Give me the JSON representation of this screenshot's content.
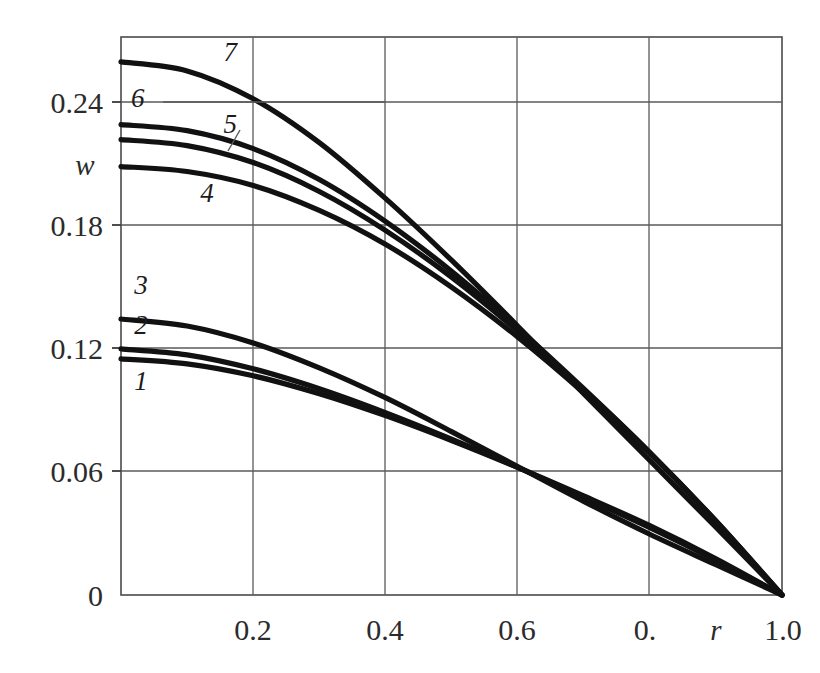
{
  "chart_data": {
    "type": "line",
    "title": "",
    "xlabel": "r",
    "ylabel": "w",
    "xlim": [
      0.0,
      1.0
    ],
    "ylim": [
      0.0,
      0.28
    ],
    "grid": true,
    "legend": "inline-curve-numbers",
    "x_ticks": [
      {
        "value": 0.2,
        "label": "0.2"
      },
      {
        "value": 0.4,
        "label": "0.4"
      },
      {
        "value": 0.6,
        "label": "0.6"
      },
      {
        "value": 0.8,
        "label": "0."
      },
      {
        "value": 1.0,
        "label": "1.0"
      }
    ],
    "y_ticks": [
      {
        "value": 0.0,
        "label": "0"
      },
      {
        "value": 0.06,
        "label": "0.06"
      },
      {
        "value": 0.12,
        "label": "0.12"
      },
      {
        "value": 0.18,
        "label": "0.18"
      },
      {
        "value": 0.24,
        "label": "0.24"
      }
    ],
    "x": [
      0.0,
      0.1,
      0.2,
      0.3,
      0.4,
      0.5,
      0.6,
      0.7,
      0.8,
      0.9,
      1.0
    ],
    "series": [
      {
        "name": "1",
        "label": "1",
        "values": [
          0.1185,
          0.116,
          0.11,
          0.101,
          0.09,
          0.0775,
          0.064,
          0.0497,
          0.0348,
          0.0182,
          0.0
        ]
      },
      {
        "name": "2",
        "label": "2",
        "values": [
          0.1235,
          0.1205,
          0.1135,
          0.1035,
          0.0915,
          0.0782,
          0.064,
          0.049,
          0.0338,
          0.0175,
          0.0
        ]
      },
      {
        "name": "3",
        "label": "3",
        "values": [
          0.1385,
          0.135,
          0.1265,
          0.114,
          0.099,
          0.082,
          0.0645,
          0.047,
          0.0305,
          0.0152,
          0.0
        ]
      },
      {
        "name": "4",
        "label": "4",
        "values": [
          0.215,
          0.2125,
          0.2055,
          0.193,
          0.176,
          0.1545,
          0.1295,
          0.1015,
          0.071,
          0.037,
          0.0
        ]
      },
      {
        "name": "5",
        "label": "5",
        "values": [
          0.2285,
          0.2255,
          0.217,
          0.2025,
          0.183,
          0.1595,
          0.1325,
          0.103,
          0.0715,
          0.0372,
          0.0
        ]
      },
      {
        "name": "6",
        "label": "6",
        "values": [
          0.236,
          0.233,
          0.224,
          0.2085,
          0.1875,
          0.1625,
          0.134,
          0.1035,
          0.0715,
          0.037,
          0.0
        ]
      },
      {
        "name": "7",
        "label": "7",
        "values": [
          0.2675,
          0.263,
          0.249,
          0.227,
          0.199,
          0.168,
          0.135,
          0.101,
          0.0675,
          0.034,
          0.0
        ]
      }
    ],
    "annotations": [
      {
        "name": "curve-label-1",
        "text": "1",
        "x": 0.02,
        "y": 0.103
      },
      {
        "name": "curve-label-2",
        "text": "2",
        "x": 0.02,
        "y": 0.131
      },
      {
        "name": "curve-label-3",
        "text": "3",
        "x": 0.02,
        "y": 0.151
      },
      {
        "name": "curve-label-4",
        "text": "4",
        "x": 0.12,
        "y": 0.197
      },
      {
        "name": "curve-label-5",
        "text": "5",
        "x": 0.155,
        "y": 0.232
      },
      {
        "name": "curve-label-6",
        "text": "6",
        "x": 0.015,
        "y": 0.245
      },
      {
        "name": "curve-label-7",
        "text": "7",
        "x": 0.155,
        "y": 0.268
      }
    ]
  }
}
